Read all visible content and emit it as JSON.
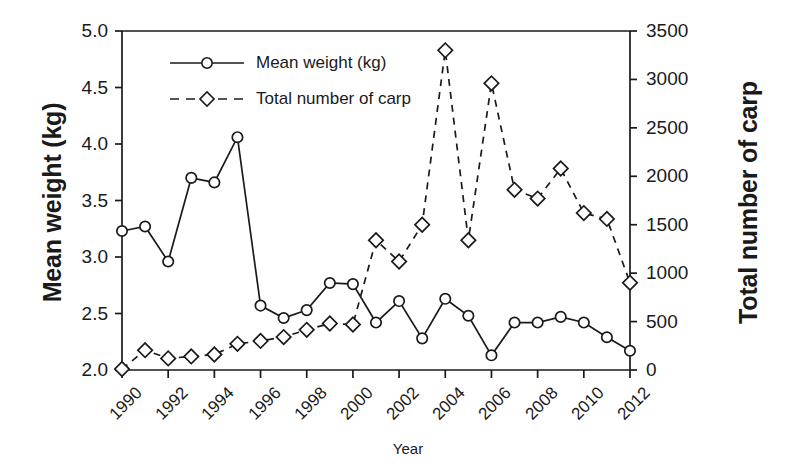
{
  "chart_data": {
    "type": "line",
    "title": "",
    "xlabel": "Year",
    "ylabel": "Mean weight (kg)",
    "y2label": "Total number of carp",
    "grid": false,
    "legend_position": "upper-left-inside",
    "xlim": [
      1990,
      2012
    ],
    "ylim": [
      2.0,
      5.0
    ],
    "y2lim": [
      0,
      3500
    ],
    "x": [
      1990,
      1991,
      1992,
      1993,
      1994,
      1995,
      1996,
      1997,
      1998,
      1999,
      2000,
      2001,
      2002,
      2003,
      2004,
      2005,
      2006,
      2007,
      2008,
      2009,
      2010,
      2011,
      2012
    ],
    "categories": [
      "1990",
      "1991",
      "1992",
      "1993",
      "1994",
      "1995",
      "1996",
      "1997",
      "1998",
      "1999",
      "2000",
      "2001",
      "2002",
      "2003",
      "2004",
      "2005",
      "2006",
      "2007",
      "2008",
      "2009",
      "2010",
      "2011",
      "2012"
    ],
    "xticks": [
      1990,
      1992,
      1994,
      1996,
      1998,
      2000,
      2002,
      2004,
      2006,
      2008,
      2010,
      2012
    ],
    "xtick_labels": [
      "1990",
      "1992",
      "1994",
      "1996",
      "1998",
      "2000",
      "2002",
      "2004",
      "2006",
      "2008",
      "2010",
      "2012"
    ],
    "yticks": [
      2.0,
      2.5,
      3.0,
      3.5,
      4.0,
      4.5,
      5.0
    ],
    "ytick_labels": [
      "2.0",
      "2.5",
      "3.0",
      "3.5",
      "4.0",
      "4.5",
      "5.0"
    ],
    "y2ticks": [
      0,
      500,
      1000,
      1500,
      2000,
      2500,
      3000,
      3500
    ],
    "y2tick_labels": [
      "0",
      "500",
      "1000",
      "1500",
      "2000",
      "2500",
      "3000",
      "3500"
    ],
    "series": [
      {
        "name": "Mean weight (kg)",
        "axis": "left",
        "marker": "circle",
        "linestyle": "solid",
        "color": "#1a1a1a",
        "values": [
          3.23,
          3.27,
          2.96,
          3.7,
          3.66,
          4.06,
          2.57,
          2.46,
          2.53,
          2.77,
          2.76,
          2.42,
          2.61,
          2.28,
          2.63,
          2.48,
          2.13,
          2.42,
          2.42,
          2.47,
          2.42,
          2.29,
          2.17
        ]
      },
      {
        "name": "Total number of carp",
        "axis": "right",
        "marker": "diamond",
        "linestyle": "dashed",
        "color": "#1a1a1a",
        "values": [
          10,
          205,
          120,
          140,
          160,
          270,
          300,
          340,
          415,
          480,
          470,
          1340,
          1120,
          1500,
          3300,
          1340,
          2960,
          1860,
          1770,
          2080,
          1620,
          1560,
          900
        ]
      }
    ]
  },
  "legend": {
    "items": [
      {
        "label": "Mean weight (kg)",
        "style": "solid-circle"
      },
      {
        "label": "Total number of carp",
        "style": "dashed-diamond"
      }
    ]
  },
  "axes": {
    "left_title": "Mean weight (kg)",
    "right_title": "Total number of carp",
    "bottom_title": "Year"
  }
}
